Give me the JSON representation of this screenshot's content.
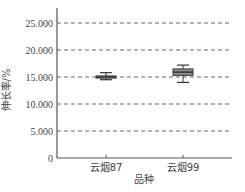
{
  "chart_data": {
    "type": "boxplot",
    "title": "",
    "xlabel": "品种",
    "ylabel": "伸长率/%",
    "ylim": [
      0,
      27500
    ],
    "yticks": [
      0,
      5000,
      10000,
      15000,
      20000,
      25000
    ],
    "ytick_labels": [
      "0",
      "5.000",
      "10.000",
      "15.000",
      "20.000",
      "25.000"
    ],
    "grid": "horizontal dashed",
    "categories": [
      "云烟87",
      "云烟99"
    ],
    "series": [
      {
        "name": "云烟87",
        "min": 14500,
        "q1": 14800,
        "median": 15000,
        "q3": 15200,
        "max": 15800
      },
      {
        "name": "云烟99",
        "min": 14000,
        "q1": 15300,
        "median": 15900,
        "q3": 16500,
        "max": 17200
      }
    ]
  },
  "colors": {
    "axis": "#555555",
    "grid": "#666666",
    "box_fill": "#8c8c8c",
    "box_dark": "#3a3a3a"
  }
}
